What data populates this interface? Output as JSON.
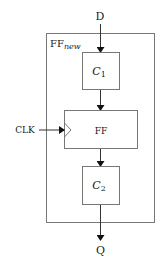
{
  "diagram": {
    "type": "block-diagram",
    "inputs": {
      "data": "D",
      "clock": "CLK"
    },
    "output": "Q",
    "container": {
      "label_main": "FF",
      "label_sub": "new"
    },
    "blocks": [
      {
        "id": "c1",
        "label_main": "C",
        "label_sub": "1"
      },
      {
        "id": "ff",
        "label_main": "FF"
      },
      {
        "id": "c2",
        "label_main": "C",
        "label_sub": "2"
      }
    ],
    "colors": {
      "stroke": "#555555",
      "text": "#1a1a1a",
      "arrow": "#111111"
    }
  }
}
